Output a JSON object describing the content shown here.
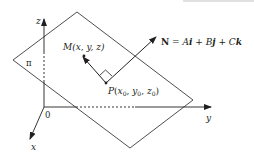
{
  "diagram": {
    "type": "plane-normal-vector-3d",
    "colors": {
      "line": "#231f20",
      "plane": "#3a3a3a",
      "top_rule": "#d6d6d6"
    },
    "axes": {
      "z": {
        "label": "z"
      },
      "y": {
        "label": "y"
      },
      "x": {
        "label": "x"
      },
      "origin": {
        "label": "0"
      }
    },
    "plane": {
      "label": "π"
    },
    "points": {
      "M": {
        "name": "M",
        "coords": "(x, y, z)"
      },
      "P": {
        "name": "P",
        "x": "x",
        "y": "y",
        "z": "z",
        "sub": "0"
      }
    },
    "normal": {
      "lhs": "N",
      "eq": " = ",
      "A": "A",
      "i": "i",
      "plus1": " + ",
      "B": "B",
      "j": "j",
      "plus2": " + ",
      "C": "C",
      "k": "k"
    }
  }
}
